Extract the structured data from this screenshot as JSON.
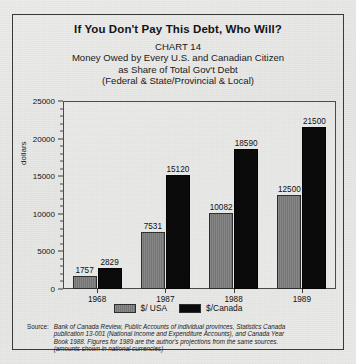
{
  "figure": {
    "title": "If You Don't Pay This Debt, Who Will?",
    "subtitle_lines": [
      "CHART 14",
      "Money Owed by Every U.S. and Canadian Citizen",
      "as Share of Total Gov't Debt",
      "(Federal & State/Provincial & Local)"
    ],
    "source_caption": "Source:",
    "source_lines": [
      "Bank of Canada Review, Public Accounts of individual provinces, Statistics Canada",
      "publication 13-001 (National Income and Expenditure Accounts), and  Canada Year",
      "Book 1988. Figures for 1989 are the author's projections from the same sources.",
      "(amounts shown in national currencies)"
    ]
  },
  "chart_data": {
    "type": "bar",
    "title": "If You Don't Pay This Debt, Who Will?",
    "subtitle": "CHART 14 — Money Owed by Every U.S. and Canadian Citizen as Share of Total Gov't Debt (Federal & State/Provincial & Local)",
    "categories": [
      "1968",
      "1987",
      "1988",
      "1989"
    ],
    "series": [
      {
        "name": "$/ USA",
        "color": "#7d7d7d",
        "values": [
          1757,
          7531,
          10082,
          12500
        ]
      },
      {
        "name": "$/Canada",
        "color": "#0b0b0b",
        "values": [
          2829,
          15120,
          18590,
          21500
        ]
      }
    ],
    "xlabel": "",
    "ylabel": "dollars",
    "ylim": [
      0,
      25000
    ],
    "yticks": [
      0,
      5000,
      10000,
      15000,
      20000,
      25000
    ],
    "ytick_labels": [
      "0",
      "5000",
      "10000",
      "15000",
      "20000",
      "25000"
    ],
    "minor_tick_interval": 1000,
    "grid": false,
    "legend_position": "bottom",
    "data_labels": true
  }
}
